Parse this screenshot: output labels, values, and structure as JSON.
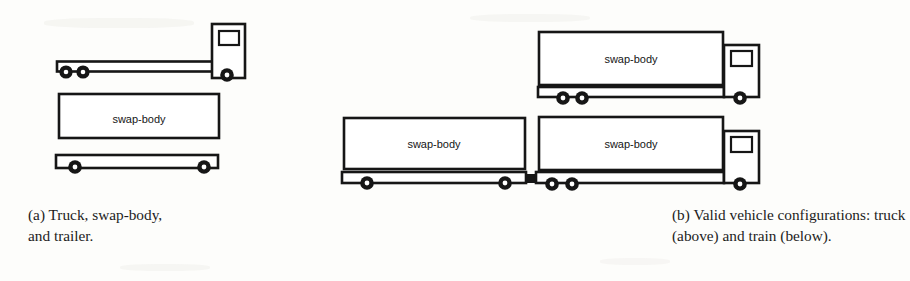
{
  "figure": {
    "background_color": "#fdfdfb",
    "ink_color": "#1a1a1a",
    "width": 793,
    "height": 281
  },
  "panels": [
    {
      "tag": "(a)",
      "caption_line1_words": [
        "Truck,",
        "swap-body,"
      ],
      "caption_line2": "and trailer.",
      "caption_full": "(a) Truck, swap-body, and trailer.",
      "components": [
        {
          "name": "truck",
          "labels": [],
          "has_cab": true,
          "wheels": 3,
          "description": "empty truck chassis with cab"
        },
        {
          "name": "swap-body",
          "labels": [
            "swap-body"
          ],
          "has_cab": false,
          "wheels": 0,
          "description": "detached swap-body container"
        },
        {
          "name": "trailer",
          "labels": [],
          "has_cab": false,
          "wheels": 2,
          "description": "empty trailer chassis"
        }
      ]
    },
    {
      "tag": "(b)",
      "caption_line1_words": [
        "Valid",
        "vehicle",
        "configurations:",
        "truck"
      ],
      "caption_line2": "(above) and train (below).",
      "caption_full": "(b) Valid vehicle configurations: truck (above) and train (below).",
      "components": [
        {
          "name": "truck-configuration",
          "labels": [
            "swap-body"
          ],
          "has_cab": true,
          "wheels": 3,
          "description": "truck carrying one swap-body"
        },
        {
          "name": "train-configuration",
          "labels": [
            "swap-body",
            "swap-body"
          ],
          "has_cab": true,
          "wheels": 5,
          "description": "trailer with swap-body coupled to truck with swap-body"
        }
      ]
    }
  ],
  "labels": {
    "swap_body": "swap-body"
  }
}
